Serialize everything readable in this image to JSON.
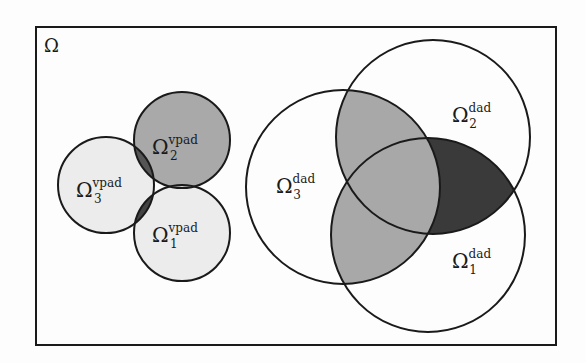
{
  "diagram": {
    "domain_label": "Ω",
    "colors": {
      "background": "#fdfdfd",
      "stroke": "#1a1a1a",
      "light_fill": "#e8e8e8",
      "mid_fill": "#a8a8a8",
      "dark_fill": "#3a3a3a"
    },
    "vpad_group": {
      "circles": [
        {
          "id": "1",
          "label": "Ω",
          "sub": "1",
          "sup": "vpad"
        },
        {
          "id": "2",
          "label": "Ω",
          "sub": "2",
          "sup": "vpad"
        },
        {
          "id": "3",
          "label": "Ω",
          "sub": "3",
          "sup": "vpad"
        }
      ]
    },
    "dad_group": {
      "circles": [
        {
          "id": "1",
          "label": "Ω",
          "sub": "1",
          "sup": "dad"
        },
        {
          "id": "2",
          "label": "Ω",
          "sub": "2",
          "sup": "dad"
        },
        {
          "id": "3",
          "label": "Ω",
          "sub": "3",
          "sup": "dad"
        }
      ]
    }
  }
}
